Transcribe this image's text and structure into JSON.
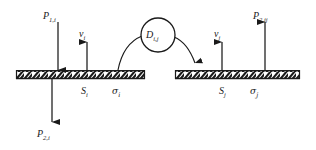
{
  "figure": {
    "background_color": "#ffffff",
    "line_color": "#1a1a1a",
    "width": 316,
    "height": 150
  },
  "labels": {
    "p1i": {
      "base": "P",
      "sub": "1,i"
    },
    "p2i": {
      "base": "P",
      "sub": "2,i"
    },
    "p2ij": {
      "base": "P",
      "sub": "2,ij"
    },
    "vi": {
      "base": "v",
      "sub": "i"
    },
    "vj": {
      "base": "v",
      "sub": "j"
    },
    "si": {
      "base": "S",
      "sub": "i"
    },
    "sj": {
      "base": "S",
      "sub": "j"
    },
    "sigma_i": {
      "base": "σ",
      "sub": "i"
    },
    "sigma_j": {
      "base": "σ",
      "sub": "j"
    },
    "dij": {
      "base": "D",
      "sub": "i,j"
    }
  },
  "elements": {
    "left_plate": {
      "name": "left-hatched-plate",
      "x": 16,
      "y": 70,
      "width": 129,
      "height": 9
    },
    "right_plate": {
      "name": "right-hatched-plate",
      "x": 175,
      "y": 70,
      "width": 125,
      "height": 9
    },
    "diffusion_circle": {
      "name": "diffusion-circle",
      "cx": 158,
      "cy": 35,
      "r": 17
    },
    "arrow_p1i": {
      "direction": "down",
      "x": 58,
      "y_start": 22,
      "y_end": 70
    },
    "arrow_vi": {
      "direction": "up",
      "x": 87,
      "y_start": 70,
      "y_end": 42
    },
    "arrow_p2i": {
      "direction": "down",
      "x": 52,
      "y_start": 79,
      "y_end": 122
    },
    "arrow_vj": {
      "direction": "up",
      "x": 222,
      "y_start": 70,
      "y_end": 42
    },
    "arrow_p2ij": {
      "direction": "up",
      "x": 265,
      "y_start": 70,
      "y_end": 22
    },
    "leader_sigma_i": {
      "from_plate_x": 118,
      "to_circle": true
    },
    "leader_sigma_j": {
      "from_circle": true,
      "to_plate_x": 196,
      "arrowhead": true
    }
  }
}
